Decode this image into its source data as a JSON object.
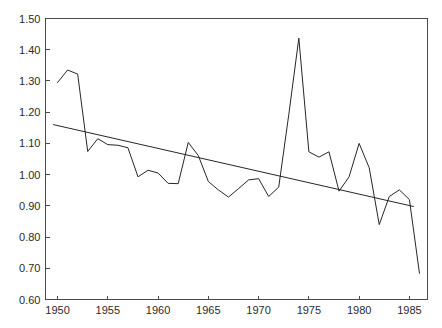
{
  "chart_data": {
    "type": "line",
    "title": "",
    "subtitle": "",
    "xlabel": "",
    "ylabel": "",
    "xlim": [
      1948.8,
      1986.8
    ],
    "ylim": [
      0.6,
      1.5
    ],
    "grid": false,
    "legend": null,
    "xticks": [
      1950,
      1955,
      1960,
      1965,
      1970,
      1975,
      1980,
      1985
    ],
    "xtick_labels": [
      "1950",
      "1955",
      "1960",
      "1965",
      "1970",
      "1975",
      "1980",
      "1985"
    ],
    "yticks": [
      0.6,
      0.7,
      0.8,
      0.9,
      1.0,
      1.1,
      1.2,
      1.3,
      1.4,
      1.5
    ],
    "ytick_labels": [
      "0.60",
      "0.70",
      "0.80",
      "0.90",
      "1.00",
      "1.10",
      "1.20",
      "1.30",
      "1.40",
      "1.50"
    ],
    "x": [
      1950,
      1951,
      1952,
      1953,
      1954,
      1955,
      1956,
      1957,
      1958,
      1959,
      1960,
      1961,
      1962,
      1963,
      1964,
      1965,
      1966,
      1967,
      1968,
      1969,
      1970,
      1971,
      1972,
      1973,
      1974,
      1975,
      1976,
      1977,
      1978,
      1979,
      1980,
      1981,
      1982,
      1983,
      1984,
      1985,
      1986
    ],
    "series": [
      {
        "name": "observed",
        "kind": "data-line",
        "values": [
          1.295,
          1.335,
          1.322,
          1.074,
          1.115,
          1.096,
          1.094,
          1.086,
          0.993,
          1.014,
          1.005,
          0.972,
          0.971,
          1.103,
          1.061,
          0.978,
          0.951,
          0.928,
          0.955,
          0.983,
          0.987,
          0.93,
          0.96,
          1.192,
          1.437,
          1.073,
          1.056,
          1.073,
          0.947,
          0.993,
          1.1,
          1.022,
          0.84,
          0.93,
          0.951,
          0.92,
          0.684
        ]
      },
      {
        "name": "linear trend",
        "kind": "trend-line",
        "x_endpoints": [
          1949.6,
          1985.4
        ],
        "y_endpoints": [
          1.16,
          0.898
        ]
      }
    ],
    "annotations": []
  },
  "axes": {
    "frame_color": "#4a4a4a",
    "line_color": "#262626",
    "background": "#ffffff"
  },
  "top_fragment": {
    "text": "",
    "visible": false
  }
}
